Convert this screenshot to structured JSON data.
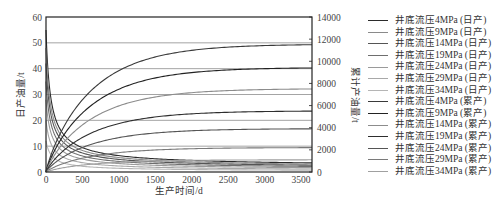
{
  "chart_data": {
    "type": "line",
    "title": "",
    "xlabel": "生产时间/d",
    "ylabel_left": "日产油量/t",
    "ylabel_right": "累计产油量/t",
    "xlim": [
      0,
      3650
    ],
    "ylim_left": [
      0,
      60
    ],
    "ylim_right": [
      0,
      14000
    ],
    "x_ticks": [
      0,
      500,
      1000,
      1500,
      2000,
      2500,
      3000,
      3500
    ],
    "y_ticks_left": [
      0,
      10,
      20,
      30,
      40,
      50,
      60
    ],
    "y_ticks_right": [
      0,
      2000,
      4000,
      6000,
      8000,
      10000,
      12000,
      14000
    ],
    "grid": "horizontal",
    "legend_position": "right",
    "series": [
      {
        "name": "井底流压4MPa (日产)",
        "axis": "left",
        "kind": "daily",
        "color": "#2b2b2b",
        "q0": 55,
        "end": 2.0
      },
      {
        "name": "井底流压9MPa (日产)",
        "axis": "left",
        "kind": "daily",
        "color": "#8a8a8a",
        "q0": 48,
        "end": 1.7
      },
      {
        "name": "井底流压14MPa (日产)",
        "axis": "left",
        "kind": "daily",
        "color": "#555555",
        "q0": 42,
        "end": 1.4
      },
      {
        "name": "井底流压19MPa (日产)",
        "axis": "left",
        "kind": "daily",
        "color": "#6e6e6e",
        "q0": 35,
        "end": 1.1
      },
      {
        "name": "井底流压24MPa (日产)",
        "axis": "left",
        "kind": "daily",
        "color": "#9a9a9a",
        "q0": 28,
        "end": 0.8
      },
      {
        "name": "井底流压29MPa (日产)",
        "axis": "left",
        "kind": "daily",
        "color": "#a8a8a8",
        "q0": 20,
        "end": 0.5
      },
      {
        "name": "井底流压34MPa (日产)",
        "axis": "left",
        "kind": "daily",
        "color": "#b5b5b5",
        "q0": 12,
        "end": 0.3
      },
      {
        "name": "井底流压4MPa (累产)",
        "axis": "right",
        "kind": "cumulative",
        "color": "#3a3a3a",
        "end": 11500
      },
      {
        "name": "井底流压9MPa (累产)",
        "axis": "right",
        "kind": "cumulative",
        "color": "#222222",
        "end": 9400
      },
      {
        "name": "井底流压14MPa (累产)",
        "axis": "right",
        "kind": "cumulative",
        "color": "#8c8c8c",
        "end": 7500
      },
      {
        "name": "井底流压19MPa (累产)",
        "axis": "right",
        "kind": "cumulative",
        "color": "#2e2e2e",
        "end": 5500
      },
      {
        "name": "井底流压24MPa (累产)",
        "axis": "right",
        "kind": "cumulative",
        "color": "#555555",
        "end": 3900
      },
      {
        "name": "井底流压29MPa (累产)",
        "axis": "right",
        "kind": "cumulative",
        "color": "#7a7a7a",
        "end": 2200
      },
      {
        "name": "井底流压34MPa (累产)",
        "axis": "right",
        "kind": "cumulative",
        "color": "#a0a0a0",
        "end": 1100
      }
    ]
  }
}
